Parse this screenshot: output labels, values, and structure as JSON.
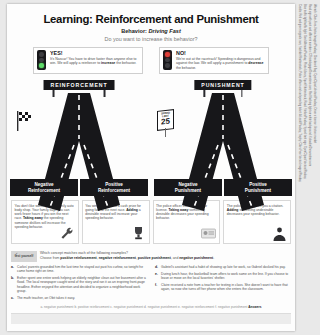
{
  "poster": {
    "title": "Learning: Reinforcement and Punishment",
    "subtitle_label": "Behavior:",
    "subtitle_value": "Driving Fast",
    "question": "Do you want to increase this behavior?"
  },
  "callouts": [
    {
      "icon": "traffic-light-green-icon",
      "head": "YES!",
      "body_pre": "It's Nascar! You have to drive faster than anyone else to win. We will apply a reinforcer to ",
      "body_bold": "increase",
      "body_post": " the behavior."
    },
    {
      "icon": "traffic-light-red-icon",
      "head": "NO!",
      "body_pre": "We're out at the racetrack! Speeding is dangerous and against the law. We will apply a punishment to ",
      "body_bold": "decrease",
      "body_post": " the behavior."
    }
  ],
  "diagram": {
    "left_banner": "REINFORCEMENT",
    "right_banner": "PUNISHMENT",
    "left_sign": "checkered-flag-icon",
    "right_sign": {
      "name": "speed-limit-sign",
      "line1": "SPEED LIMIT",
      "line2": "25"
    },
    "quadrants": [
      {
        "title_line1": "Negative",
        "title_line2": "Reinforcement",
        "icon": "wrench-icon",
        "text_pre": "You don't like working in the family auto body shop. Your family says you can work fewer hours if you win the next race. ",
        "text_bold": "Taking away",
        "text_post": " the speeding someone dislikes will increase the speeding behavior."
      },
      {
        "title_line1": "Positive",
        "title_line2": "Reinforcement",
        "icon": "trophy-icon",
        "text_pre": "You win a trophy and a cash prize for going fast at the next race. ",
        "text_bold": "Adding",
        "text_post": " a desirable reward will increase your speeding behavior."
      },
      {
        "title_line1": "Negative",
        "title_line2": "Punishment",
        "icon": "drivers-license-icon",
        "text_pre": "The police officer confiscates your license. ",
        "text_bold": "Taking away",
        "text_post": " something desirable decreases your speeding behavior."
      },
      {
        "title_line1": "Positive",
        "title_line2": "Punishment",
        "icon": "police-officer-icon",
        "text_pre": "The police officer gives you a citation. ",
        "text_bold": "Adding",
        "text_post": " something undesirable decreases your speeding behavior."
      }
    ]
  },
  "test_yourself": {
    "badge_label": "test yourself",
    "badge_icon": "check-mark-icon",
    "prompt": "Which concept matches each of the following examples?",
    "choices_pre": "Choose from ",
    "choices": [
      "positive reinforcement",
      "negative reinforcement",
      "positive punishment",
      "negative punishment"
    ],
    "items": [
      {
        "label": "a.",
        "text": "Carlos' parents grounded him the last time he stayed out past his curfew, so tonight he came home right on time."
      },
      {
        "label": "b.",
        "text": "Esther spent one entire week helping an elderly neighbor clean out her basement after a flood. The local newspaper caught wind of the story and ran it as an inspiring front-page headline. Esther enjoyed the attention and decided to organize a neighborhood work group."
      },
      {
        "label": "c.",
        "text": "The math teacher, an Obit takes it easy."
      },
      {
        "label": "d.",
        "text": "Gabriel's assistant had a habit of showing up late for work, so Gabriel docked his pay."
      },
      {
        "label": "e.",
        "text": "During lunch hour, the basketball team offers to work same on the line. If you choose to leave or move on the local favorites' shelter."
      },
      {
        "label": "f.",
        "text": "Claire received a note from a teacher for texting in class. She doesn't want to have that again, so now she turns off her phone when she enters the classroom."
      }
    ],
    "answers_prefix": "",
    "answers": "a. negative punishment  b. positive reinforcement  c. negative punishment  d. negative punishment  e. negative reinforcement  f. negative punishment",
    "answers_label": "Answers"
  },
  "credits": {
    "line1": "Credits: Red and green signals: iam, Sashkin/Shutterstock; Police officer and car/speeding ticket: A Lesik/Pixabay; Trophy: Clker-Free-Vector-Images/Pixabay",
    "line2": "Blue traffic light/traffic light: Gerd Altmann/Pixabay; Photo Library, Sport/Shutterstock; Road: Stefan/Pixabay; Speed limit sign: OpenClipart-Vectors/Pixabay",
    "line3": "Road sign with post and different numbers: CThistolagage/Dreamstime.com; Red flashing light on white background: Koloadin/Dreamstime.com",
    "line4": "Wrench: Clker-Free-Vector-Images/Pixabay; Checkered flag: OpenClipart-Vectors/Pixabay; Driver's license: Vectors market"
  }
}
